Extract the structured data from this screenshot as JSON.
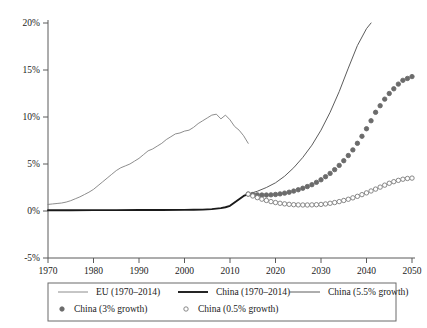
{
  "chart_data": {
    "type": "line",
    "title": "",
    "xlabel": "",
    "ylabel": "",
    "xlim": [
      1970,
      2050
    ],
    "ylim": [
      -5,
      20
    ],
    "grid": false,
    "legend_position": "bottom",
    "x_ticks": [
      "1970",
      "1980",
      "1990",
      "2000",
      "2010",
      "2020",
      "2030",
      "2040",
      "2050"
    ],
    "y_ticks": [
      "20%",
      "15%",
      "10%",
      "5%",
      "0%",
      "-5%"
    ],
    "series": [
      {
        "name": "EU (1970–2014)",
        "style": "thin-line",
        "color": "#808080",
        "x": [
          1970,
          1971,
          1972,
          1973,
          1974,
          1975,
          1976,
          1977,
          1978,
          1979,
          1980,
          1981,
          1982,
          1983,
          1984,
          1985,
          1986,
          1987,
          1988,
          1989,
          1990,
          1991,
          1992,
          1993,
          1994,
          1995,
          1996,
          1997,
          1998,
          1999,
          2000,
          2001,
          2002,
          2003,
          2004,
          2005,
          2006,
          2007,
          2008,
          2009,
          2010,
          2011,
          2012,
          2013,
          2014
        ],
        "values": [
          0.7,
          0.75,
          0.8,
          0.85,
          0.95,
          1.1,
          1.3,
          1.5,
          1.75,
          2.0,
          2.3,
          2.7,
          3.1,
          3.5,
          3.9,
          4.3,
          4.6,
          4.8,
          5.0,
          5.3,
          5.6,
          6.0,
          6.4,
          6.6,
          6.9,
          7.2,
          7.6,
          7.9,
          8.2,
          8.3,
          8.5,
          8.6,
          8.9,
          9.3,
          9.6,
          9.9,
          10.2,
          10.3,
          9.8,
          10.2,
          9.7,
          9.0,
          8.6,
          8.0,
          7.2
        ]
      },
      {
        "name": "China (1970–2014)",
        "style": "thick-line",
        "color": "#1a1a1a",
        "x": [
          1970,
          1975,
          1980,
          1985,
          1990,
          1995,
          2000,
          2002,
          2004,
          2006,
          2008,
          2009,
          2010,
          2011,
          2012,
          2013,
          2014
        ],
        "values": [
          0.08,
          0.08,
          0.09,
          0.09,
          0.1,
          0.1,
          0.12,
          0.13,
          0.15,
          0.2,
          0.3,
          0.4,
          0.55,
          0.9,
          1.25,
          1.6,
          1.8
        ]
      },
      {
        "name": "China (5.5% growth)",
        "style": "thin-line",
        "color": "#4a4a4a",
        "x": [
          2014,
          2016,
          2018,
          2020,
          2022,
          2024,
          2026,
          2028,
          2030,
          2032,
          2034,
          2036,
          2038,
          2040,
          2041
        ],
        "values": [
          1.8,
          2.1,
          2.5,
          3.0,
          3.7,
          4.6,
          5.7,
          7.0,
          8.6,
          10.5,
          12.7,
          15.2,
          17.6,
          19.4,
          20.0
        ]
      },
      {
        "name": "China (3% growth)",
        "style": "filled-circles",
        "color": "#6b6b6b",
        "x": [
          2014,
          2015,
          2016,
          2017,
          2018,
          2019,
          2020,
          2021,
          2022,
          2023,
          2024,
          2025,
          2026,
          2027,
          2028,
          2029,
          2030,
          2031,
          2032,
          2033,
          2034,
          2035,
          2036,
          2037,
          2038,
          2039,
          2040,
          2041,
          2042,
          2043,
          2044,
          2045,
          2046,
          2047,
          2048,
          2049,
          2050
        ],
        "values": [
          1.8,
          1.75,
          1.72,
          1.7,
          1.7,
          1.72,
          1.76,
          1.82,
          1.9,
          2.0,
          2.12,
          2.26,
          2.42,
          2.6,
          2.8,
          3.05,
          3.32,
          3.65,
          4.0,
          4.4,
          4.85,
          5.35,
          5.9,
          6.5,
          7.2,
          7.95,
          8.75,
          9.6,
          10.5,
          11.2,
          11.9,
          12.5,
          13.0,
          13.5,
          13.9,
          14.1,
          14.3
        ]
      },
      {
        "name": "China (0.5% growth)",
        "style": "open-circles",
        "color": "#7a7a7a",
        "x": [
          2014,
          2015,
          2016,
          2017,
          2018,
          2019,
          2020,
          2021,
          2022,
          2023,
          2024,
          2025,
          2026,
          2027,
          2028,
          2029,
          2030,
          2031,
          2032,
          2033,
          2034,
          2035,
          2036,
          2037,
          2038,
          2039,
          2040,
          2041,
          2042,
          2043,
          2044,
          2045,
          2046,
          2047,
          2048,
          2049,
          2050
        ],
        "values": [
          1.8,
          1.6,
          1.42,
          1.26,
          1.12,
          1.0,
          0.9,
          0.82,
          0.76,
          0.71,
          0.67,
          0.65,
          0.64,
          0.64,
          0.65,
          0.67,
          0.7,
          0.75,
          0.82,
          0.9,
          1.0,
          1.12,
          1.25,
          1.4,
          1.56,
          1.74,
          1.93,
          2.13,
          2.33,
          2.54,
          2.75,
          2.95,
          3.12,
          3.26,
          3.38,
          3.46,
          3.5
        ]
      }
    ]
  },
  "legend": {
    "items": [
      {
        "label": "EU (1970–2014)",
        "marker": "thin-line"
      },
      {
        "label": "China (1970–2014)",
        "marker": "thick-line"
      },
      {
        "label": "China (5.5% growth)",
        "marker": "thin-line"
      },
      {
        "label": "China (3% growth)",
        "marker": "filled-circle"
      },
      {
        "label": "China (0.5% growth)",
        "marker": "open-circle"
      }
    ]
  },
  "colors": {
    "eu_line": "#808080",
    "china_line": "#1a1a1a",
    "growth_line": "#4a4a4a",
    "marker_filled": "#6b6b6b",
    "marker_open": "#7a7a7a",
    "axis": "#5a5a5a",
    "text": "#1a1a1a"
  }
}
